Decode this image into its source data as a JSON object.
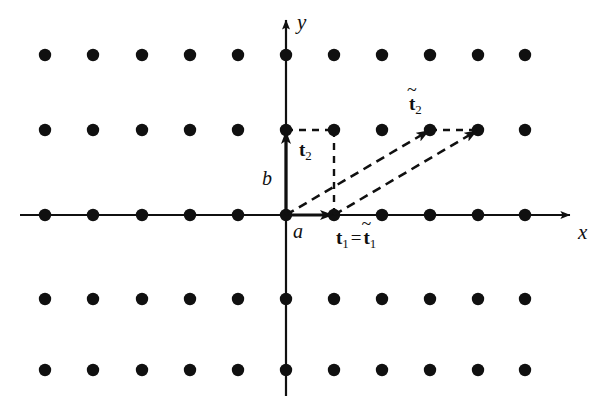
{
  "figure": {
    "kind": "lattice-basis-vector-diagram",
    "width": 604,
    "height": 404,
    "background_color": "#ffffff",
    "ink_color": "#101010"
  },
  "axes": {
    "x_label": "x",
    "y_label": "y",
    "origin": {
      "x": 286,
      "y": 215
    },
    "x_axis": {
      "x1": 20,
      "y1": 215,
      "x2": 578,
      "y2": 215,
      "style": "solid",
      "arrow": "end"
    },
    "y_axis": {
      "x1": 286,
      "y1": 392,
      "x2": 286,
      "y2": 14,
      "style": "solid",
      "arrow": "end"
    }
  },
  "lattice": {
    "dot_radius": 6.2,
    "dot_color": "#101010",
    "columns_x": [
      45,
      93,
      142,
      190,
      238,
      286,
      334,
      382,
      430,
      478,
      525,
      525
    ],
    "rows_y": [
      55,
      130,
      215,
      299,
      370
    ],
    "points_x": [
      45,
      93,
      142,
      190,
      238,
      286,
      334,
      382,
      430,
      478,
      525
    ],
    "points_y": [
      55,
      130,
      215,
      299,
      370
    ]
  },
  "vectors": [
    {
      "id": "t1",
      "label": "t",
      "subscript": "1",
      "tilde": false,
      "style": "solid",
      "from": {
        "x": 286,
        "y": 215
      },
      "to": {
        "x": 334,
        "y": 215
      },
      "description": "primitive vector t1 along x from origin"
    },
    {
      "id": "t2",
      "label": "t",
      "subscript": "2",
      "tilde": false,
      "style": "solid",
      "from": {
        "x": 286,
        "y": 215
      },
      "to": {
        "x": 286,
        "y": 130
      },
      "description": "primitive vector t2 along y from origin"
    },
    {
      "id": "t2tilde",
      "label": "t",
      "subscript": "2",
      "tilde": true,
      "style": "dashed",
      "from": {
        "x": 286,
        "y": 215
      },
      "to": {
        "x": 430,
        "y": 130
      },
      "description": "alternative primitive vector t2 tilde from origin"
    },
    {
      "id": "t2tilde-shifted",
      "label": "",
      "subscript": "",
      "tilde": true,
      "style": "dashed",
      "from": {
        "x": 334,
        "y": 215
      },
      "to": {
        "x": 478,
        "y": 130
      },
      "description": "copy of t2 tilde translated to t1"
    }
  ],
  "guides": [
    {
      "id": "guide-top",
      "x1": 286,
      "y1": 130,
      "x2": 334,
      "y2": 130,
      "style": "dashed"
    },
    {
      "id": "guide-right",
      "x1": 334,
      "y1": 130,
      "x2": 334,
      "y2": 215,
      "style": "dashed"
    },
    {
      "id": "guide-upper-right",
      "x1": 430,
      "y1": 130,
      "x2": 478,
      "y2": 130,
      "style": "dashed"
    }
  ],
  "labels": {
    "y_axis": {
      "text": "y",
      "x": 297,
      "y": 12,
      "italic": true
    },
    "x_axis": {
      "text": "x",
      "x": 578,
      "y": 222,
      "italic": true
    },
    "a": {
      "text": "a",
      "x": 293,
      "y": 221,
      "italic": true
    },
    "b": {
      "text": "b",
      "x": 262,
      "y": 168,
      "italic": true
    },
    "t2": {
      "base": "t",
      "sub": "2",
      "x": 299,
      "y": 140
    },
    "t1_eq_t1tilde": {
      "lhs_base": "t",
      "lhs_sub": "1",
      "equals": "=",
      "rhs_base": "t",
      "rhs_sub": "1",
      "tilde": "~",
      "x": 336,
      "y": 228
    },
    "t2tilde": {
      "base": "t",
      "sub": "2",
      "tilde": "~",
      "x": 409,
      "y": 94
    }
  },
  "chart_data": {
    "type": "scatter",
    "title": "",
    "xlabel": "x",
    "ylabel": "y",
    "lattice_constants": {
      "a": "a",
      "b": "b"
    },
    "lattice_points": [
      [
        45,
        55
      ],
      [
        93,
        55
      ],
      [
        142,
        55
      ],
      [
        190,
        55
      ],
      [
        238,
        55
      ],
      [
        286,
        55
      ],
      [
        334,
        55
      ],
      [
        382,
        55
      ],
      [
        430,
        55
      ],
      [
        478,
        55
      ],
      [
        525,
        55
      ],
      [
        45,
        130
      ],
      [
        93,
        130
      ],
      [
        142,
        130
      ],
      [
        190,
        130
      ],
      [
        238,
        130
      ],
      [
        286,
        130
      ],
      [
        334,
        130
      ],
      [
        382,
        130
      ],
      [
        430,
        130
      ],
      [
        478,
        130
      ],
      [
        525,
        130
      ],
      [
        45,
        215
      ],
      [
        93,
        215
      ],
      [
        142,
        215
      ],
      [
        190,
        215
      ],
      [
        238,
        215
      ],
      [
        286,
        215
      ],
      [
        334,
        215
      ],
      [
        382,
        215
      ],
      [
        430,
        215
      ],
      [
        478,
        215
      ],
      [
        525,
        215
      ],
      [
        45,
        299
      ],
      [
        93,
        299
      ],
      [
        142,
        299
      ],
      [
        190,
        299
      ],
      [
        238,
        299
      ],
      [
        286,
        299
      ],
      [
        334,
        299
      ],
      [
        382,
        299
      ],
      [
        430,
        299
      ],
      [
        478,
        299
      ],
      [
        525,
        299
      ],
      [
        45,
        370
      ],
      [
        93,
        370
      ],
      [
        142,
        370
      ],
      [
        190,
        370
      ],
      [
        238,
        370
      ],
      [
        286,
        370
      ],
      [
        334,
        370
      ],
      [
        382,
        370
      ],
      [
        430,
        370
      ],
      [
        478,
        370
      ],
      [
        525,
        370
      ]
    ],
    "annotations": [
      "t1",
      "t2",
      "t2 tilde",
      "t1 = t1 tilde",
      "a",
      "b",
      "x",
      "y"
    ]
  }
}
